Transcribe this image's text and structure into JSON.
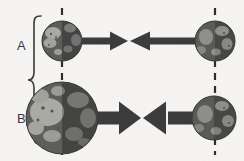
{
  "figure": {
    "width": 244,
    "height": 161,
    "background_color": "#f6f5f3",
    "type": "scientific-diagram"
  },
  "brace": {
    "name": "panel-brace",
    "color": "#3a3a3a",
    "spans": [
      "A",
      "B"
    ]
  },
  "rows": [
    {
      "id": "A",
      "label": "A",
      "label_color": "#3a3a3a",
      "left_body": {
        "name": "planet-a-left",
        "cx": 62,
        "cy": 41,
        "r": 20,
        "body_color": "#4a4a4a",
        "land_color": "#a8a8a4",
        "shadow_color": "#343434"
      },
      "right_body": {
        "name": "planet-a-right",
        "cx": 215,
        "cy": 41,
        "r": 20,
        "body_color": "#4a4a4a",
        "land_color": "#a8a8a4",
        "shadow_color": "#343434"
      },
      "left_arrow": {
        "name": "force-arrow-a-left",
        "from_x": 82,
        "to_x": 128,
        "y": 41,
        "shaft_thickness": 7,
        "head_length": 16,
        "head_width": 19,
        "color": "#3c3c3c",
        "direction": "right"
      },
      "right_arrow": {
        "name": "force-arrow-a-right",
        "from_x": 196,
        "to_x": 130,
        "y": 41,
        "shaft_thickness": 7,
        "head_length": 16,
        "head_width": 19,
        "color": "#3c3c3c",
        "direction": "left"
      }
    },
    {
      "id": "B",
      "label": "B",
      "label_color": "#3a3a3a",
      "left_body": {
        "name": "planet-b-left",
        "cx": 62,
        "cy": 118,
        "r": 36,
        "body_color": "#4a4a4a",
        "land_color": "#a8a8a4",
        "shadow_color": "#343434"
      },
      "right_body": {
        "name": "planet-b-right",
        "cx": 214,
        "cy": 118,
        "r": 22,
        "body_color": "#4a4a4a",
        "land_color": "#a8a8a4",
        "shadow_color": "#343434"
      },
      "left_arrow": {
        "name": "force-arrow-b-left",
        "from_x": 96,
        "to_x": 141,
        "y": 118,
        "shaft_thickness": 13,
        "head_length": 22,
        "head_width": 33,
        "color": "#3c3c3c",
        "direction": "right"
      },
      "right_arrow": {
        "name": "force-arrow-b-right",
        "from_x": 194,
        "to_x": 143,
        "y": 118,
        "shaft_thickness": 13,
        "head_length": 22,
        "head_width": 33,
        "color": "#3c3c3c",
        "direction": "left"
      }
    }
  ],
  "axis_lines": [
    {
      "name": "dashed-axis-left",
      "x": 62,
      "y1": 8,
      "y2": 155,
      "color": "#2e2e2e",
      "style": "dashed",
      "dash": "7 6",
      "width": 2
    },
    {
      "name": "dashed-axis-right",
      "x": 215,
      "y1": 8,
      "y2": 155,
      "color": "#2e2e2e",
      "style": "dashed",
      "dash": "7 6",
      "width": 2
    }
  ]
}
